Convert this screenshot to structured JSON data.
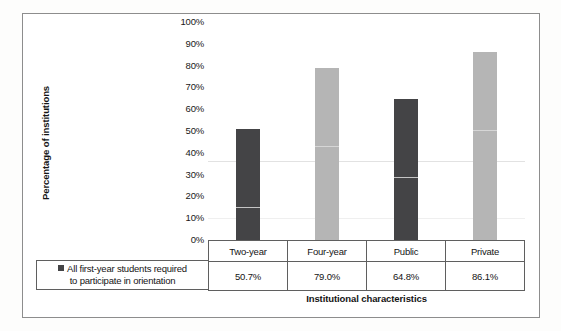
{
  "chart_data": {
    "type": "bar",
    "title": "",
    "xlabel": "Institutional characteristics",
    "ylabel": "Percentage of institutions",
    "categories": [
      "Two-year",
      "Four-year",
      "Public",
      "Private"
    ],
    "values": [
      50.7,
      79.0,
      64.8,
      86.1
    ],
    "value_labels": [
      "50.7%",
      "79.0%",
      "64.8%",
      "86.1%"
    ],
    "series": [
      {
        "name": "All first-year students required to participate in orientation",
        "values": [
          50.7,
          79.0,
          64.8,
          86.1
        ],
        "colors": [
          "#444446",
          "#b5b5b5",
          "#444446",
          "#b5b5b5"
        ]
      }
    ],
    "ylim": [
      0,
      100
    ],
    "ytick_labels": [
      "100%",
      "90%",
      "80%",
      "70%",
      "60%",
      "50%",
      "40%",
      "30%",
      "20%",
      "10%",
      "0%"
    ],
    "ytick_values": [
      100,
      90,
      80,
      70,
      60,
      50,
      40,
      30,
      20,
      10,
      0
    ],
    "grid": false,
    "legend_position": "below-left",
    "bar_color_dark": "#444446",
    "bar_color_light": "#b5b5b5"
  },
  "legend": {
    "line1": "All first-year students required",
    "line2": "to participate in orientation"
  },
  "table": {
    "header": [
      "Two-year",
      "Four-year",
      "Public",
      "Private"
    ],
    "values": [
      "50.7%",
      "79.0%",
      "64.8%",
      "86.1%"
    ]
  },
  "axis": {
    "y_title": "Percentage of institutions",
    "x_title": "Institutional characteristics"
  }
}
